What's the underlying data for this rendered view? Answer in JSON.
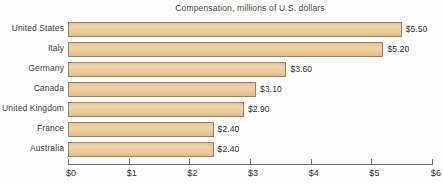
{
  "chart_data": {
    "type": "bar",
    "orientation": "horizontal",
    "title": "Compensation, millions of U.S. dollars",
    "xlabel": "",
    "ylabel": "",
    "xlim": [
      0,
      6
    ],
    "grid": false,
    "legend": null,
    "categories": [
      "United States",
      "Italy",
      "Germany",
      "Canada",
      "United Kingdom",
      "France",
      "Australia"
    ],
    "values": [
      5.5,
      5.2,
      3.6,
      3.1,
      2.9,
      2.4,
      2.4
    ],
    "value_labels": [
      "$5.50",
      "$5.20",
      "$3.60",
      "$3.10",
      "$2.90",
      "$2.40",
      "$2.40"
    ],
    "xticks": [
      0,
      1,
      2,
      3,
      4,
      5,
      6
    ],
    "xtick_labels": [
      "$0",
      "$1",
      "$2",
      "$3",
      "$4",
      "$5",
      "$6"
    ],
    "colors": {
      "bar_fill": "#e9cb9b",
      "bar_border": "#9a8363",
      "axis": "#6f6f6f",
      "text": "#2f2f2f",
      "title_text": "#4a4a4a",
      "background": "#fefefe"
    }
  }
}
